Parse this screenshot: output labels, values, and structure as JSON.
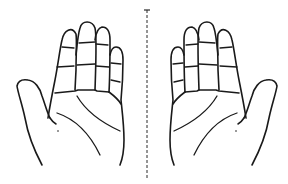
{
  "figure": {
    "description": "Line drawing of two open palms mirrored across a dashed vertical symmetry axis",
    "left_hand": {
      "label": "left palm",
      "side": "left"
    },
    "right_hand": {
      "label": "right palm",
      "side": "right"
    },
    "axis": {
      "label": "symmetry axis",
      "style": "dashed",
      "color": "#2a2a2a"
    },
    "colors": {
      "background": "#ffffff",
      "ink": "#1a1a1a"
    }
  }
}
